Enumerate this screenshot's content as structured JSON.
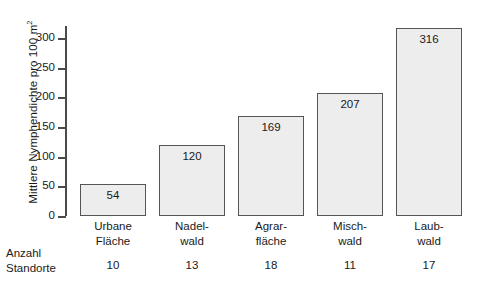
{
  "chart_data": {
    "type": "bar",
    "title": "",
    "xlabel": "",
    "ylabel": "Mittlere Nymphendichte pro 100 m",
    "ylabel_sup": "2",
    "categories": [
      "Urbane Fläche",
      "Nadel-wald",
      "Agrar-fläche",
      "Misch-wald",
      "Laub-wald"
    ],
    "category_lines": [
      [
        "Urbane",
        "Fläche"
      ],
      [
        "Nadel-",
        "wald"
      ],
      [
        "Agrar-",
        "fläche"
      ],
      [
        "Misch-",
        "wald"
      ],
      [
        "Laub-",
        "wald"
      ]
    ],
    "values": [
      54,
      120,
      169,
      207,
      316
    ],
    "value_labels": [
      "54",
      "120",
      "169",
      "207",
      "316"
    ],
    "ylim": [
      0,
      320
    ],
    "yticks": [
      0,
      50,
      100,
      150,
      200,
      250,
      300
    ],
    "ytick_labels": [
      "0",
      "50",
      "100",
      "150",
      "200",
      "250",
      "300"
    ],
    "grid": false,
    "legend": false,
    "secondary_row": {
      "header_lines": [
        "Anzahl",
        "Standorte"
      ],
      "label": "Anzahl Standorte",
      "values": [
        10,
        13,
        18,
        11,
        17
      ],
      "value_labels": [
        "10",
        "13",
        "18",
        "11",
        "17"
      ]
    },
    "colors": {
      "bar_fill": "#ededed",
      "bar_border": "#555555",
      "axis": "#4a4a4a",
      "text": "#1a1a1a",
      "background": "#ffffff"
    }
  }
}
